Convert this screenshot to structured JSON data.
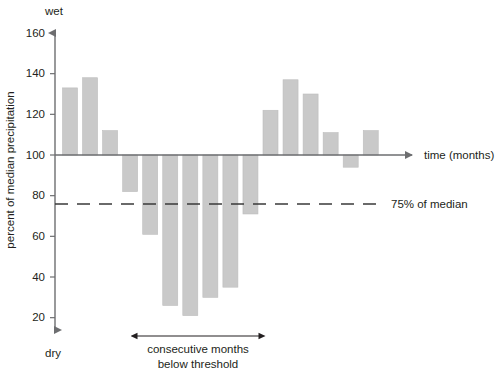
{
  "chart_data": {
    "type": "bar",
    "title": "",
    "subtitle": "",
    "xlabel": "time (months)",
    "ylabel": "percent of median precipitation",
    "ylim": [
      0,
      168
    ],
    "yticks": [
      20,
      40,
      60,
      80,
      100,
      120,
      140,
      160
    ],
    "ytick_labels": [
      "20",
      "40",
      "60",
      "80",
      "100",
      "120",
      "140",
      "160"
    ],
    "grid": false,
    "legend": false,
    "baseline": 100,
    "baseline_note": "bars drawn relative to the 100% median line",
    "axis_pole_labels": {
      "top": "wet",
      "bottom": "dry"
    },
    "threshold": {
      "value": 75,
      "label": "75% of median",
      "style": "dashed"
    },
    "bar_color": "#c9c9c9",
    "bar_edge_color": "#bdbdbd",
    "axis_color": "#6d6e70",
    "categories": [
      "1",
      "2",
      "3",
      "4",
      "5",
      "6",
      "7",
      "8",
      "9",
      "10",
      "11",
      "12",
      "13",
      "14",
      "15",
      "16"
    ],
    "values": [
      133,
      138,
      112,
      82,
      61,
      26,
      21,
      30,
      35,
      71,
      122,
      137,
      130,
      111,
      94,
      112
    ],
    "below_threshold_flags": [
      false,
      false,
      false,
      false,
      true,
      true,
      true,
      true,
      true,
      true,
      false,
      false,
      false,
      false,
      false,
      false
    ],
    "annotation": {
      "text_line1": "consecutive months",
      "text_line2": "below threshold",
      "span_start_category": "4",
      "span_end_category": "10",
      "arrow_style": "double-headed"
    }
  },
  "axes": {
    "y_axis_name": "y-axis",
    "x_axis_name": "x-axis"
  }
}
